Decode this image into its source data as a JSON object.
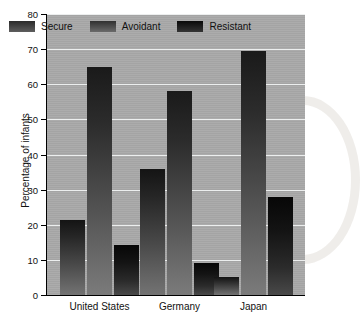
{
  "chart_data": {
    "type": "bar",
    "title": "",
    "xlabel": "",
    "ylabel": "Percentage of infants",
    "ylim": [
      0,
      80
    ],
    "yticks": [
      "0",
      "10",
      "20",
      "30",
      "40",
      "50",
      "60",
      "70",
      "80"
    ],
    "grid": true,
    "legend_position": "top-inside",
    "categories": [
      "United States",
      "Germany",
      "Japan"
    ],
    "series": [
      {
        "name": "Secure",
        "values": [
          21.4,
          35.8,
          5.0
        ]
      },
      {
        "name": "Avoidant",
        "values": [
          64.8,
          58.0,
          69.5
        ]
      },
      {
        "name": "Resistant",
        "values": [
          14.2,
          9.0,
          27.8
        ]
      }
    ],
    "colors": {
      "plot_background": "#a9a9a9",
      "gridline": "#eceeee",
      "axis": "#000000",
      "secure": "#3a3a3a",
      "avoidant": "#404040",
      "resistant": "#141414"
    }
  }
}
